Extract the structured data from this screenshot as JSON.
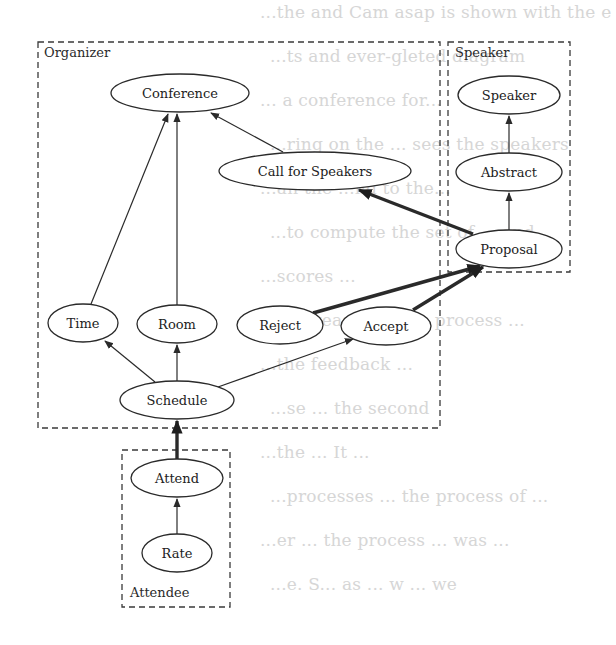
{
  "background_text": [
    "...the and Cam asap is shown with the e",
    "...ts and ever-gleted diagram",
    "... a conference for...",
    "...ring on the ... sees the speakers",
    "...an the ...nd to the...",
    "...to compute the set of ... and",
    "...scores ...",
    "...increase ... at ... process ...",
    "...the feedback ...",
    "...se ... the second",
    "...the ... It ...",
    "...processes ... the process of ...",
    "...er ... the process ... was ...",
    "...e. S... as ... w ... we"
  ],
  "clusters": [
    {
      "id": "organizer",
      "label": "Organizer",
      "x": 38,
      "y": 42,
      "w": 402,
      "h": 386,
      "label_x": 44,
      "label_y": 57
    },
    {
      "id": "speaker",
      "label": "Speaker",
      "x": 448,
      "y": 42,
      "w": 122,
      "h": 230,
      "label_x": 455,
      "label_y": 57
    },
    {
      "id": "attendee",
      "label": "Attendee",
      "x": 122,
      "y": 450,
      "w": 108,
      "h": 157,
      "label_x": 130,
      "label_y": 597
    }
  ],
  "nodes": [
    {
      "id": "conference",
      "label": "Conference",
      "cx": 180,
      "cy": 93,
      "rx": 69,
      "ry": 19
    },
    {
      "id": "call-for-speakers",
      "label": "Call for Speakers",
      "cx": 315,
      "cy": 171,
      "rx": 96,
      "ry": 19
    },
    {
      "id": "time",
      "label": "Time",
      "cx": 83,
      "cy": 323,
      "rx": 35,
      "ry": 19
    },
    {
      "id": "room",
      "label": "Room",
      "cx": 177,
      "cy": 324,
      "rx": 40,
      "ry": 19
    },
    {
      "id": "reject",
      "label": "Reject",
      "cx": 280,
      "cy": 325,
      "rx": 43,
      "ry": 19
    },
    {
      "id": "accept",
      "label": "Accept",
      "cx": 386,
      "cy": 326,
      "rx": 45,
      "ry": 19
    },
    {
      "id": "schedule",
      "label": "Schedule",
      "cx": 177,
      "cy": 400,
      "rx": 57,
      "ry": 19
    },
    {
      "id": "speaker",
      "label": "Speaker",
      "cx": 509,
      "cy": 95,
      "rx": 51,
      "ry": 19
    },
    {
      "id": "abstract",
      "label": "Abstract",
      "cx": 509,
      "cy": 172,
      "rx": 53,
      "ry": 19
    },
    {
      "id": "proposal",
      "label": "Proposal",
      "cx": 509,
      "cy": 249,
      "rx": 53,
      "ry": 19
    },
    {
      "id": "attend",
      "label": "Attend",
      "cx": 177,
      "cy": 478,
      "rx": 46,
      "ry": 19
    },
    {
      "id": "rate",
      "label": "Rate",
      "cx": 177,
      "cy": 553,
      "rx": 35,
      "ry": 19
    }
  ],
  "edges": [
    {
      "from": "time",
      "to": "conference",
      "bold": false,
      "x1": 91,
      "y1": 304,
      "x2": 168,
      "y2": 114
    },
    {
      "from": "room",
      "to": "conference",
      "bold": false,
      "x1": 177,
      "y1": 305,
      "x2": 177,
      "y2": 114
    },
    {
      "from": "call-for-speakers",
      "to": "conference",
      "bold": false,
      "x1": 283,
      "y1": 152,
      "x2": 211,
      "y2": 113
    },
    {
      "from": "schedule",
      "to": "time",
      "bold": false,
      "x1": 155,
      "y1": 382,
      "x2": 105,
      "y2": 341
    },
    {
      "from": "schedule",
      "to": "room",
      "bold": false,
      "x1": 177,
      "y1": 381,
      "x2": 177,
      "y2": 345
    },
    {
      "from": "schedule",
      "to": "accept",
      "bold": false,
      "x1": 218,
      "y1": 387,
      "x2": 353,
      "y2": 339
    },
    {
      "from": "proposal",
      "to": "call-for-speakers",
      "bold": true,
      "x1": 473,
      "y1": 234,
      "x2": 359,
      "y2": 190
    },
    {
      "from": "reject",
      "to": "proposal",
      "bold": true,
      "x1": 313,
      "y1": 313,
      "x2": 480,
      "y2": 266
    },
    {
      "from": "accept",
      "to": "proposal",
      "bold": true,
      "x1": 413,
      "y1": 310,
      "x2": 483,
      "y2": 267
    },
    {
      "from": "abstract",
      "to": "speaker",
      "bold": false,
      "x1": 509,
      "y1": 153,
      "x2": 509,
      "y2": 116
    },
    {
      "from": "proposal",
      "to": "abstract",
      "bold": false,
      "x1": 509,
      "y1": 230,
      "x2": 509,
      "y2": 193
    },
    {
      "from": "attend",
      "to": "schedule",
      "bold": true,
      "x1": 177,
      "y1": 459,
      "x2": 177,
      "y2": 421
    },
    {
      "from": "rate",
      "to": "attend",
      "bold": false,
      "x1": 177,
      "y1": 534,
      "x2": 177,
      "y2": 499
    }
  ]
}
